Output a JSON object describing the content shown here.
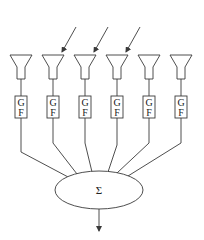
{
  "diagram": {
    "type": "array beamformer block diagram",
    "elements": [
      {
        "id": "e1",
        "box_top": "G",
        "box_bottom": "F",
        "incident_arrow": false
      },
      {
        "id": "e2",
        "box_top": "G",
        "box_bottom": "F",
        "incident_arrow": true
      },
      {
        "id": "e3",
        "box_top": "G",
        "box_bottom": "F",
        "incident_arrow": true
      },
      {
        "id": "e4",
        "box_top": "G",
        "box_bottom": "F",
        "incident_arrow": true
      },
      {
        "id": "e5",
        "box_top": "G",
        "box_bottom": "F",
        "incident_arrow": false
      },
      {
        "id": "e6",
        "box_top": "G",
        "box_bottom": "F",
        "incident_arrow": false
      }
    ],
    "summer": {
      "symbol": "Σ"
    },
    "output_arrow": true,
    "colors": {
      "stroke": "#3a3a3a",
      "background": "#ffffff"
    }
  }
}
